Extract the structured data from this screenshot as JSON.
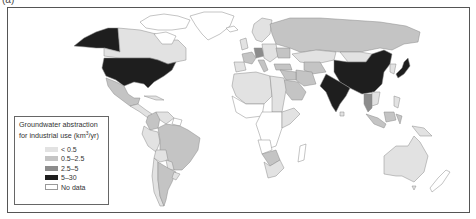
{
  "figure": {
    "panel_label": "(a)"
  },
  "legend": {
    "title_line1": "Groundwater abstraction",
    "title_line2_prefix": "for industrial use (km",
    "title_line2_sup": "3",
    "title_line2_suffix": "/yr)",
    "items": [
      {
        "label": "< 0.5",
        "color": "#e2e2e2"
      },
      {
        "label": "0.5–2.5",
        "color": "#c4c4c4"
      },
      {
        "label": "2.5–5",
        "color": "#8c8c8c"
      },
      {
        "label": "5–30",
        "color": "#1e1e1e"
      },
      {
        "label": "No data",
        "color": "#ffffff"
      }
    ]
  },
  "colors": {
    "lt05": "#e2e2e2",
    "c05_25": "#c4c4c4",
    "c25_5": "#8c8c8c",
    "c5_30": "#1e1e1e",
    "nodata": "#ffffff",
    "border": "#8a8a8a",
    "frame": "#555555"
  },
  "regions": [
    {
      "name": "Alaska (USA)",
      "class": "5–30"
    },
    {
      "name": "Canada",
      "class": "< 0.5"
    },
    {
      "name": "Canadian Arctic Islands",
      "class": "No data"
    },
    {
      "name": "Greenland",
      "class": "No data"
    },
    {
      "name": "United States",
      "class": "5–30"
    },
    {
      "name": "Mexico",
      "class": "0.5–2.5"
    },
    {
      "name": "Central America",
      "class": "< 0.5"
    },
    {
      "name": "Caribbean",
      "class": "< 0.5"
    },
    {
      "name": "Colombia",
      "class": "0.5–2.5"
    },
    {
      "name": "Venezuela",
      "class": "< 0.5"
    },
    {
      "name": "Guianas",
      "class": "No data"
    },
    {
      "name": "Ecuador",
      "class": "< 0.5"
    },
    {
      "name": "Peru",
      "class": "< 0.5"
    },
    {
      "name": "Brazil",
      "class": "0.5–2.5"
    },
    {
      "name": "Bolivia",
      "class": "< 0.5"
    },
    {
      "name": "Paraguay",
      "class": "< 0.5"
    },
    {
      "name": "Chile",
      "class": "< 0.5"
    },
    {
      "name": "Argentina",
      "class": "0.5–2.5"
    },
    {
      "name": "Uruguay",
      "class": "< 0.5"
    },
    {
      "name": "Iceland",
      "class": "No data"
    },
    {
      "name": "Scandinavia",
      "class": "< 0.5"
    },
    {
      "name": "United Kingdom",
      "class": "< 0.5"
    },
    {
      "name": "France",
      "class": "0.5–2.5"
    },
    {
      "name": "Iberia",
      "class": "< 0.5"
    },
    {
      "name": "Germany",
      "class": "2.5–5"
    },
    {
      "name": "Italy",
      "class": "0.5–2.5"
    },
    {
      "name": "Eastern Europe",
      "class": "< 0.5"
    },
    {
      "name": "Ukraine",
      "class": "0.5–2.5"
    },
    {
      "name": "Russia",
      "class": "0.5–2.5"
    },
    {
      "name": "Kazakhstan",
      "class": "< 0.5"
    },
    {
      "name": "Central Asia",
      "class": "0.5–2.5"
    },
    {
      "name": "Turkey",
      "class": "0.5–2.5"
    },
    {
      "name": "Iran",
      "class": "0.5–2.5"
    },
    {
      "name": "Saudi Arabia",
      "class": "0.5–2.5"
    },
    {
      "name": "Middle East",
      "class": "0.5–2.5"
    },
    {
      "name": "Mongolia",
      "class": "< 0.5"
    },
    {
      "name": "China",
      "class": "5–30"
    },
    {
      "name": "India",
      "class": "5–30"
    },
    {
      "name": "Japan",
      "class": "5–30"
    },
    {
      "name": "Korea",
      "class": "< 0.5"
    },
    {
      "name": "Thailand",
      "class": "2.5–5"
    },
    {
      "name": "Southeast Asia",
      "class": "< 0.5"
    },
    {
      "name": "Indonesia",
      "class": "0.5–2.5"
    },
    {
      "name": "Philippines",
      "class": "< 0.5"
    },
    {
      "name": "Papua New Guinea",
      "class": "< 0.5"
    },
    {
      "name": "North Africa",
      "class": "< 0.5"
    },
    {
      "name": "Egypt",
      "class": "< 0.5"
    },
    {
      "name": "Sahel",
      "class": "< 0.5"
    },
    {
      "name": "West Africa",
      "class": "No data"
    },
    {
      "name": "Central Africa",
      "class": "No data"
    },
    {
      "name": "East Africa",
      "class": "< 0.5"
    },
    {
      "name": "Angola",
      "class": "No data"
    },
    {
      "name": "Botswana",
      "class": "0.5–2.5"
    },
    {
      "name": "South Africa",
      "class": "< 0.5"
    },
    {
      "name": "Madagascar",
      "class": "No data"
    },
    {
      "name": "Australia",
      "class": "< 0.5"
    },
    {
      "name": "New Zealand",
      "class": "No data"
    }
  ]
}
